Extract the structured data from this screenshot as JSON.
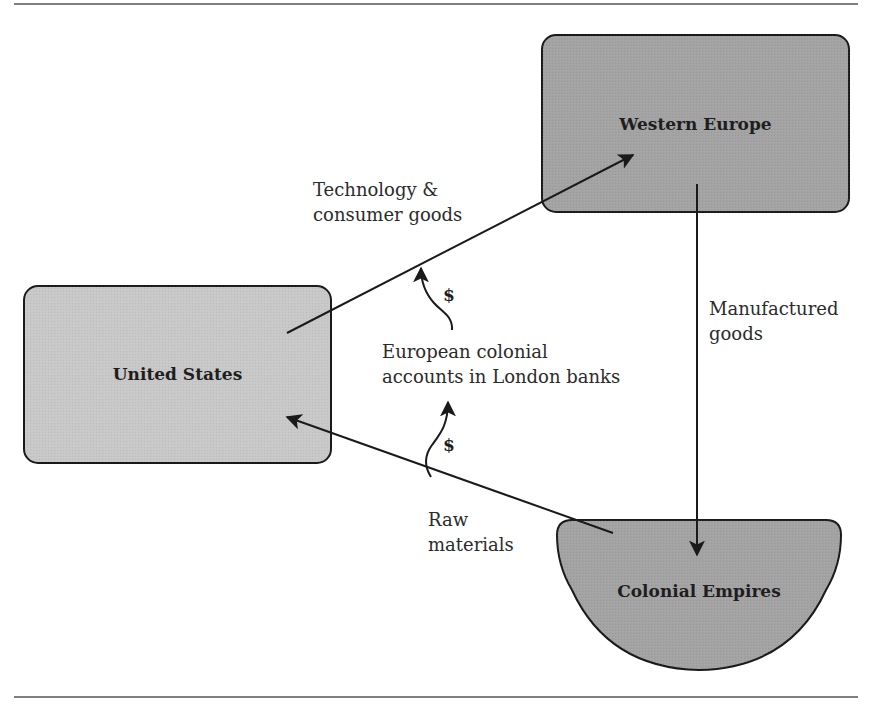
{
  "diagram": {
    "nodes": {
      "western_europe": {
        "label": "Western Europe",
        "fill": "#a3a3a3"
      },
      "united_states": {
        "label": "United States",
        "fill": "#c8c8c8"
      },
      "colonial_empires": {
        "label": "Colonial Empires",
        "fill": "#a3a3a3"
      }
    },
    "edges": {
      "us_to_europe": {
        "label_line1": "Technology &",
        "label_line2": "consumer goods"
      },
      "europe_to_colonies": {
        "label_line1": "Manufactured",
        "label_line2": "goods"
      },
      "colonies_to_us": {
        "label_line1": "Raw",
        "label_line2": "materials"
      }
    },
    "flows": {
      "intermediary": {
        "label_line1": "European colonial",
        "label_line2": "accounts in London banks"
      },
      "money_upper": {
        "symbol": "$"
      },
      "money_lower": {
        "symbol": "$"
      }
    },
    "colors": {
      "stroke": "#1a1a1a",
      "rule": "#555555",
      "text": "#2b2b2b"
    }
  }
}
